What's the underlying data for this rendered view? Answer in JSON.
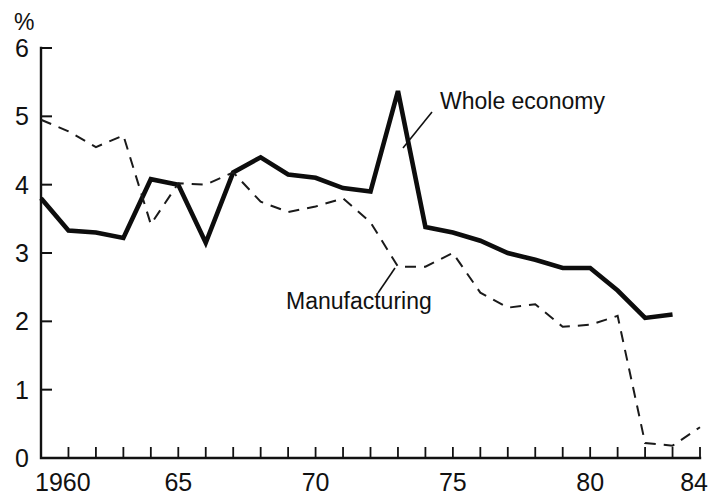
{
  "chart_data": {
    "type": "line",
    "title": "",
    "subtitle": "",
    "xlabel": "",
    "ylabel": "%",
    "unit_label": "%",
    "xlim": [
      1960,
      1984
    ],
    "ylim": [
      0,
      6
    ],
    "ytick_values": [
      0,
      1,
      2,
      3,
      4,
      5,
      6
    ],
    "ytick_labels": [
      "0",
      "1",
      "2",
      "3",
      "4",
      "5",
      "6"
    ],
    "xtick_values": [
      1960,
      1961,
      1962,
      1963,
      1964,
      1965,
      1966,
      1967,
      1968,
      1969,
      1970,
      1971,
      1972,
      1973,
      1974,
      1975,
      1976,
      1977,
      1978,
      1979,
      1980,
      1981,
      1982,
      1983,
      1984
    ],
    "xtick_labeled": [
      {
        "value": 1960,
        "label": "1960"
      },
      {
        "value": 1965,
        "label": "65"
      },
      {
        "value": 1970,
        "label": "70"
      },
      {
        "value": 1975,
        "label": "75"
      },
      {
        "value": 1980,
        "label": "80"
      },
      {
        "value": 1984,
        "label": "84"
      }
    ],
    "grid": false,
    "legend_position": "inline-annotation",
    "x": [
      1960,
      1961,
      1962,
      1963,
      1964,
      1965,
      1966,
      1967,
      1968,
      1969,
      1970,
      1971,
      1972,
      1973,
      1974,
      1975,
      1976,
      1977,
      1978,
      1979,
      1980,
      1981,
      1982,
      1983,
      1984
    ],
    "series": [
      {
        "name": "Whole economy",
        "style": "solid",
        "color": "#0d0d0d",
        "x": [
          1960,
          1961,
          1962,
          1963,
          1964,
          1965,
          1966,
          1967,
          1968,
          1969,
          1970,
          1971,
          1972,
          1973,
          1974,
          1975,
          1976,
          1977,
          1978,
          1979,
          1980,
          1981,
          1982,
          1983
        ],
        "values": [
          3.8,
          3.33,
          3.3,
          3.22,
          4.08,
          4.0,
          3.15,
          4.18,
          4.4,
          4.15,
          4.1,
          3.95,
          3.9,
          5.37,
          3.38,
          3.3,
          3.18,
          3.0,
          2.9,
          2.78,
          2.78,
          2.45,
          2.05,
          2.1
        ]
      },
      {
        "name": "Manufacturing",
        "style": "dashed",
        "color": "#1a1a1a",
        "x": [
          1960,
          1961,
          1962,
          1963,
          1964,
          1965,
          1966,
          1967,
          1968,
          1969,
          1970,
          1971,
          1972,
          1973,
          1974,
          1975,
          1976,
          1977,
          1978,
          1979,
          1980,
          1981,
          1982,
          1983,
          1984
        ],
        "values": [
          4.95,
          4.78,
          4.55,
          4.72,
          3.42,
          4.02,
          4.0,
          4.18,
          3.75,
          3.6,
          3.68,
          3.8,
          3.45,
          2.8,
          2.8,
          3.0,
          2.42,
          2.2,
          2.25,
          1.92,
          1.95,
          2.08,
          0.22,
          0.18,
          0.45
        ]
      }
    ],
    "annotations": [
      {
        "name": "whole-economy",
        "text": "Whole economy",
        "text_x": 440,
        "text_y": 109,
        "leader_from_x": 432,
        "leader_from_y": 112,
        "leader_to_x": 403,
        "leader_to_y": 148
      },
      {
        "name": "manufacturing",
        "text": "Manufacturing",
        "text_x": 286,
        "text_y": 309,
        "leader_from_x": 378,
        "leader_from_y": 293,
        "leader_to_x": 395,
        "leader_to_y": 268
      }
    ]
  }
}
